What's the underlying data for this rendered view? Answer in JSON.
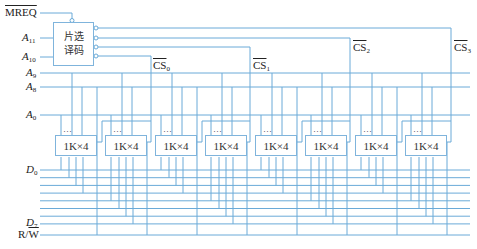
{
  "diagram": {
    "decoder": {
      "line1": "片选",
      "line2": "译码"
    },
    "inputs": {
      "mreq": "MREQ",
      "a11": {
        "base": "A",
        "sub": "11"
      },
      "a10": {
        "base": "A",
        "sub": "10"
      },
      "a9": {
        "base": "A",
        "sub": "9"
      },
      "a8": {
        "base": "A",
        "sub": "8"
      },
      "a0": {
        "base": "A",
        "sub": "0"
      },
      "d0": {
        "base": "D",
        "sub": "0"
      },
      "d7": {
        "base": "D",
        "sub": "7"
      },
      "rw": {
        "r": "R/",
        "w": "W"
      }
    },
    "chip_selects": [
      {
        "base": "CS",
        "sub": "0"
      },
      {
        "base": "CS",
        "sub": "1"
      },
      {
        "base": "CS",
        "sub": "2"
      },
      {
        "base": "CS",
        "sub": "3"
      }
    ],
    "chips": [
      {
        "label": "1K×4",
        "dots": "…"
      },
      {
        "label": "1K×4",
        "dots": "…"
      },
      {
        "label": "1K×4",
        "dots": "…"
      },
      {
        "label": "1K×4",
        "dots": "…"
      },
      {
        "label": "1K×4",
        "dots": "…"
      },
      {
        "label": "1K×4",
        "dots": "…"
      },
      {
        "label": "1K×4",
        "dots": "…"
      },
      {
        "label": "1K×4",
        "dots": "…"
      }
    ],
    "wire_color": "#6aaad8"
  }
}
